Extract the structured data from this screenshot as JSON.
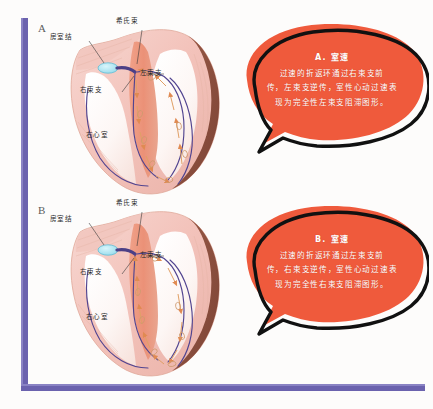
{
  "figure": {
    "background_color": "#fdfcfb",
    "frame_color": "#6b62ae"
  },
  "panels": [
    {
      "letter": "A",
      "diagram": {
        "name": "heart-cutaway-diagram-a",
        "labels": {
          "av_node": "房室结",
          "his_bundle": "希氏束",
          "left_bundle_branch": "左束支",
          "right_bundle_branch": "右束支",
          "right_ventricle": "右心室"
        }
      },
      "callout": {
        "title": "A. 室速",
        "lines": [
          "过速的折返环通过右束支前",
          "传，左束支逆传，室性心动过速表",
          "现为完全性左束支阻滞图形。"
        ],
        "fill_color": "#ef5a3c",
        "outline_color": "#111111",
        "text_color": "#ffffff"
      }
    },
    {
      "letter": "B",
      "diagram": {
        "name": "heart-cutaway-diagram-b",
        "labels": {
          "av_node": "房室结",
          "his_bundle": "希氏束",
          "left_bundle_branch": "左束支",
          "right_bundle_branch": "右束支",
          "right_ventricle": "右心室"
        }
      },
      "callout": {
        "title": "B. 室速",
        "lines": [
          "过速的折返环通过左束支前",
          "传，右束支逆传，室性心动过速表",
          "现为完全性右束支阻滞图形。"
        ],
        "fill_color": "#ef5a3c",
        "outline_color": "#111111",
        "text_color": "#ffffff"
      }
    }
  ]
}
